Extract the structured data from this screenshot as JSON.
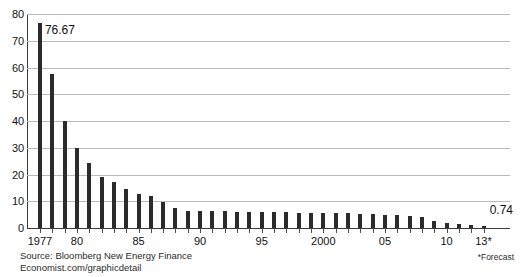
{
  "chart_data": {
    "type": "bar",
    "title": "",
    "subtitle": "",
    "xlabel": "",
    "ylabel": "",
    "ylim": [
      0,
      80
    ],
    "ytick_values": [
      0,
      10,
      20,
      30,
      40,
      50,
      60,
      70,
      80
    ],
    "ytick_labels": [
      "0",
      "10",
      "20",
      "30",
      "40",
      "50",
      "60",
      "70",
      "80"
    ],
    "grid": true,
    "legend": "none",
    "categories": [
      "1977",
      "1978",
      "1979",
      "1980",
      "1981",
      "1982",
      "1983",
      "1984",
      "1985",
      "1986",
      "1987",
      "1988",
      "1989",
      "1990",
      "1991",
      "1992",
      "1993",
      "1994",
      "1995",
      "1996",
      "1997",
      "1998",
      "1999",
      "2000",
      "2001",
      "2002",
      "2003",
      "2004",
      "2005",
      "2006",
      "2007",
      "2008",
      "2009",
      "2010",
      "2011",
      "2012",
      "2013"
    ],
    "values": [
      76.67,
      57.5,
      40.0,
      29.8,
      24.4,
      19.2,
      17.2,
      14.4,
      12.9,
      11.9,
      9.6,
      7.4,
      6.5,
      6.3,
      6.2,
      6.2,
      6.1,
      6.1,
      6.0,
      5.9,
      5.9,
      5.8,
      5.7,
      5.6,
      5.6,
      5.5,
      5.3,
      5.2,
      5.0,
      4.7,
      4.4,
      4.1,
      2.6,
      2.0,
      1.4,
      1.0,
      0.74
    ],
    "xtick_labels": [
      "1977",
      "80",
      "85",
      "90",
      "95",
      "2000",
      "05",
      "10",
      "13*"
    ],
    "xtick_categories": [
      "1977",
      "1980",
      "1985",
      "1990",
      "1995",
      "2000",
      "2005",
      "2010",
      "2013"
    ],
    "annotations": [
      {
        "name": "first-bar-value",
        "text": "76.67",
        "category": "1977",
        "value": 76.67
      },
      {
        "name": "last-bar-value",
        "text": "0.74",
        "category": "2013",
        "value": 0.74
      }
    ],
    "bar_color": "#2b2b2b",
    "gridline_color": "#b9b9b9",
    "axis_color": "#3a3a3a"
  },
  "footer": {
    "source_line_1": "Source: Bloomberg New Energy Finance",
    "source_line_2": "Economist.com/graphicdetail",
    "forecast_note": "*Forecast"
  }
}
